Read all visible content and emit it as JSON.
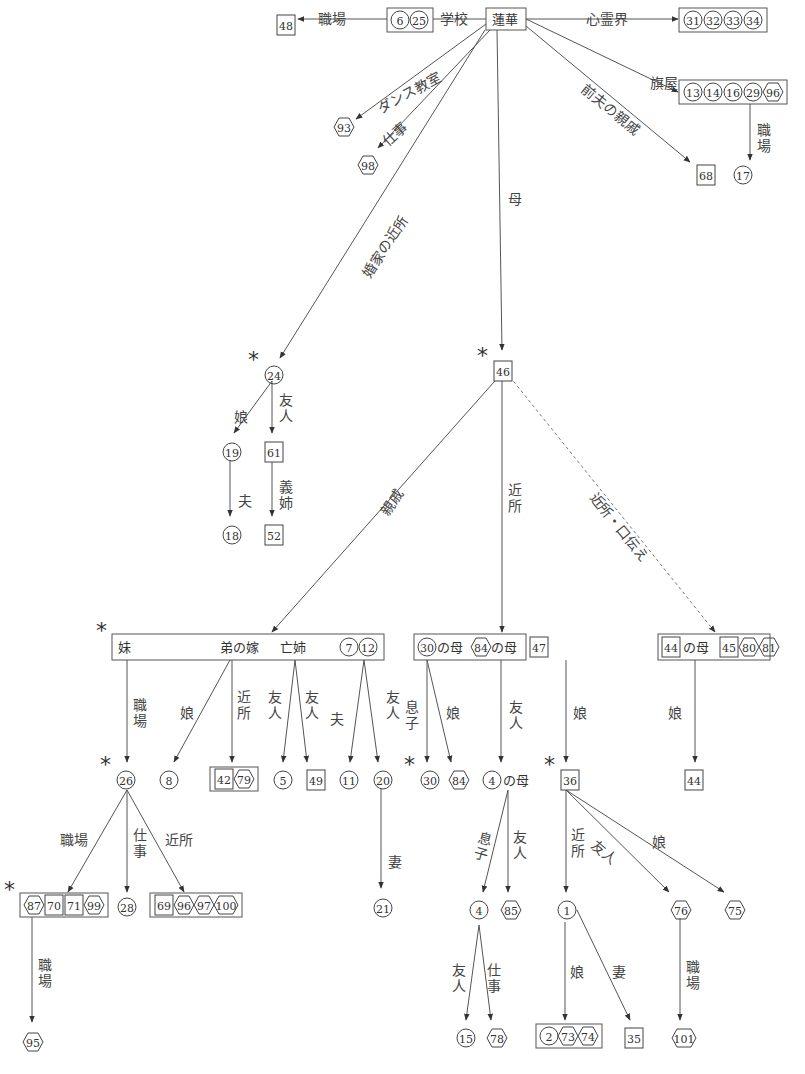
{
  "diagram": {
    "root": "蓮華",
    "nodes": [
      {
        "id": "renge",
        "text": "蓮華",
        "x": 486,
        "y": 8,
        "w": 40,
        "h": 22,
        "boxed": true
      },
      {
        "id": "school",
        "x": 387,
        "y": 8,
        "boxed": true,
        "items": [
          {
            "t": "c",
            "n": "6"
          },
          {
            "t": "c",
            "n": "25"
          }
        ]
      },
      {
        "id": "n48",
        "x": 276,
        "y": 13,
        "items": [
          {
            "t": "s",
            "n": "48"
          }
        ]
      },
      {
        "id": "tokyo",
        "x": 679,
        "y": 8,
        "boxed": true,
        "items": [
          {
            "t": "c",
            "n": "31"
          },
          {
            "t": "c",
            "n": "32"
          },
          {
            "t": "c",
            "n": "33"
          },
          {
            "t": "c",
            "n": "34"
          }
        ],
        "caption": "東京"
      },
      {
        "id": "hataya",
        "x": 679,
        "y": 80,
        "boxed": true,
        "items": [
          {
            "t": "c",
            "n": "13"
          },
          {
            "t": "c",
            "n": "14"
          },
          {
            "t": "c",
            "n": "16"
          },
          {
            "t": "c",
            "n": "29"
          },
          {
            "t": "h",
            "n": "96"
          }
        ]
      },
      {
        "id": "n93",
        "x": 334,
        "y": 115,
        "items": [
          {
            "t": "h",
            "n": "93"
          }
        ]
      },
      {
        "id": "n98",
        "x": 358,
        "y": 153,
        "items": [
          {
            "t": "h",
            "n": "98"
          }
        ]
      },
      {
        "id": "n68",
        "x": 696,
        "y": 163,
        "items": [
          {
            "t": "s",
            "n": "68"
          }
        ]
      },
      {
        "id": "n17",
        "x": 733,
        "y": 163,
        "items": [
          {
            "t": "c",
            "n": "17"
          }
        ]
      },
      {
        "id": "n24",
        "x": 264,
        "y": 363,
        "items": [
          {
            "t": "c",
            "n": "24"
          }
        ],
        "star": true
      },
      {
        "id": "n46",
        "x": 493,
        "y": 359,
        "items": [
          {
            "t": "s",
            "n": "46"
          }
        ],
        "star": true
      },
      {
        "id": "n19",
        "x": 222,
        "y": 440,
        "items": [
          {
            "t": "c",
            "n": "19"
          }
        ]
      },
      {
        "id": "n61",
        "x": 264,
        "y": 440,
        "items": [
          {
            "t": "s",
            "n": "61"
          }
        ]
      },
      {
        "id": "n18",
        "x": 222,
        "y": 523,
        "items": [
          {
            "t": "c",
            "n": "18"
          }
        ]
      },
      {
        "id": "n52",
        "x": 264,
        "y": 523,
        "items": [
          {
            "t": "s",
            "n": "52"
          }
        ]
      },
      {
        "id": "relatives",
        "x": 112,
        "y": 634,
        "w": 272,
        "h": 26,
        "boxed": true,
        "text_parts": [
          "妹",
          "弟の嫁",
          "亡姉"
        ],
        "items": [
          {
            "t": "c",
            "n": "7"
          },
          {
            "t": "c",
            "n": "12"
          }
        ],
        "star": true
      },
      {
        "id": "neighbors",
        "x": 414,
        "y": 634,
        "w": 112,
        "h": 26,
        "boxed": true,
        "text_parts": [
          "の母",
          "の母"
        ],
        "items": [
          {
            "t": "c",
            "n": "30"
          },
          {
            "t": "h",
            "n": "84"
          },
          {
            "t": "s",
            "n": "47"
          }
        ]
      },
      {
        "id": "rumor",
        "x": 658,
        "y": 634,
        "w": 112,
        "h": 26,
        "boxed": true,
        "text_parts": [
          "の母"
        ],
        "items": [
          {
            "t": "s",
            "n": "44"
          },
          {
            "t": "s",
            "n": "45"
          },
          {
            "t": "h",
            "n": "80"
          },
          {
            "t": "h",
            "n": "81"
          }
        ]
      },
      {
        "id": "n26",
        "x": 116,
        "y": 768,
        "items": [
          {
            "t": "c",
            "n": "26"
          }
        ],
        "star": true
      },
      {
        "id": "n8",
        "x": 160,
        "y": 768,
        "items": [
          {
            "t": "c",
            "n": "8"
          }
        ]
      },
      {
        "id": "g42_79",
        "x": 210,
        "y": 767,
        "boxed": true,
        "items": [
          {
            "t": "s",
            "n": "42"
          },
          {
            "t": "h",
            "n": "79"
          }
        ]
      },
      {
        "id": "n5",
        "x": 274,
        "y": 768,
        "items": [
          {
            "t": "c",
            "n": "5"
          }
        ]
      },
      {
        "id": "n49",
        "x": 306,
        "y": 768,
        "items": [
          {
            "t": "s",
            "n": "49"
          }
        ]
      },
      {
        "id": "n11",
        "x": 339,
        "y": 768,
        "items": [
          {
            "t": "c",
            "n": "11"
          }
        ]
      },
      {
        "id": "n20",
        "x": 373,
        "y": 768,
        "items": [
          {
            "t": "c",
            "n": "20"
          }
        ]
      },
      {
        "id": "n30",
        "x": 420,
        "y": 768,
        "items": [
          {
            "t": "c",
            "n": "30"
          }
        ],
        "star": true
      },
      {
        "id": "n84",
        "x": 449,
        "y": 768,
        "items": [
          {
            "t": "h",
            "n": "84"
          }
        ]
      },
      {
        "id": "mother4",
        "x": 483,
        "y": 768,
        "items": [
          {
            "t": "c",
            "n": "4"
          }
        ],
        "suffix": "の母"
      },
      {
        "id": "n36",
        "x": 560,
        "y": 768,
        "items": [
          {
            "t": "s",
            "n": "36"
          }
        ],
        "star": true
      },
      {
        "id": "n44b",
        "x": 684,
        "y": 768,
        "items": [
          {
            "t": "s",
            "n": "44"
          }
        ]
      },
      {
        "id": "g87",
        "x": 20,
        "y": 893,
        "boxed": true,
        "items": [
          {
            "t": "h",
            "n": "87"
          },
          {
            "t": "s",
            "n": "70"
          },
          {
            "t": "s",
            "n": "71"
          },
          {
            "t": "h",
            "n": "99"
          }
        ],
        "star": true
      },
      {
        "id": "n28",
        "x": 117,
        "y": 895,
        "items": [
          {
            "t": "c",
            "n": "28"
          }
        ]
      },
      {
        "id": "g69",
        "x": 150,
        "y": 893,
        "boxed": true,
        "items": [
          {
            "t": "s",
            "n": "69"
          },
          {
            "t": "h",
            "n": "96"
          },
          {
            "t": "h",
            "n": "97"
          },
          {
            "t": "h",
            "n": "100"
          }
        ]
      },
      {
        "id": "n21",
        "x": 373,
        "y": 896,
        "items": [
          {
            "t": "c",
            "n": "21"
          }
        ]
      },
      {
        "id": "n4",
        "x": 470,
        "y": 898,
        "items": [
          {
            "t": "c",
            "n": "4"
          }
        ]
      },
      {
        "id": "n85",
        "x": 501,
        "y": 898,
        "items": [
          {
            "t": "h",
            "n": "85"
          }
        ]
      },
      {
        "id": "n1",
        "x": 558,
        "y": 898,
        "items": [
          {
            "t": "c",
            "n": "1"
          }
        ]
      },
      {
        "id": "n76",
        "x": 671,
        "y": 898,
        "items": [
          {
            "t": "h",
            "n": "76"
          }
        ]
      },
      {
        "id": "n75",
        "x": 725,
        "y": 898,
        "items": [
          {
            "t": "h",
            "n": "75"
          }
        ]
      },
      {
        "id": "n95",
        "x": 23,
        "y": 1030,
        "items": [
          {
            "t": "h",
            "n": "95"
          }
        ]
      },
      {
        "id": "n15",
        "x": 456,
        "y": 1026,
        "items": [
          {
            "t": "c",
            "n": "15"
          }
        ]
      },
      {
        "id": "n78",
        "x": 487,
        "y": 1026,
        "items": [
          {
            "t": "h",
            "n": "78"
          }
        ]
      },
      {
        "id": "g2",
        "x": 536,
        "y": 1024,
        "boxed": true,
        "items": [
          {
            "t": "c",
            "n": "2"
          },
          {
            "t": "h",
            "n": "73"
          },
          {
            "t": "h",
            "n": "74"
          }
        ]
      },
      {
        "id": "n35",
        "x": 624,
        "y": 1026,
        "items": [
          {
            "t": "s",
            "n": "35"
          }
        ]
      },
      {
        "id": "n101",
        "x": 672,
        "y": 1026,
        "items": [
          {
            "t": "h",
            "n": "101"
          }
        ]
      }
    ],
    "edges": [
      {
        "from": [
          486,
          19
        ],
        "to": [
          426,
          19
        ],
        "label": "学校",
        "lx": 440,
        "ly": 12
      },
      {
        "from": [
          387,
          19
        ],
        "to": [
          298,
          19
        ],
        "label": "職場",
        "lx": 318,
        "ly": 12
      },
      {
        "from": [
          526,
          19
        ],
        "to": [
          678,
          19
        ],
        "label": "心霊界",
        "lx": 586,
        "ly": 12
      },
      {
        "from": [
          526,
          19
        ],
        "to": [
          678,
          92
        ],
        "label": "旗屋",
        "lx": 650,
        "ly": 76
      },
      {
        "from": [
          750,
          103
        ],
        "to": [
          750,
          160
        ],
        "label": "職場",
        "vertical": true,
        "lx": 757,
        "ly": 123
      },
      {
        "from": [
          486,
          24
        ],
        "to": [
          356,
          119
        ],
        "label": "ダンス教室",
        "rot": -28,
        "lx": 375,
        "ly": 103
      },
      {
        "from": [
          490,
          30
        ],
        "to": [
          378,
          148
        ],
        "label": "仕事",
        "rot": -42,
        "lx": 380,
        "ly": 138
      },
      {
        "from": [
          526,
          26
        ],
        "to": [
          690,
          162
        ],
        "label": "前夫の親戚",
        "rot": 39,
        "lx": 588,
        "ly": 82
      },
      {
        "from": [
          497,
          30
        ],
        "to": [
          502,
          350
        ],
        "label": "母",
        "lx": 508,
        "ly": 192
      },
      {
        "from": [
          485,
          30
        ],
        "to": [
          280,
          358
        ],
        "label": "婚家の近所",
        "rot": -57,
        "lx": 360,
        "ly": 272
      },
      {
        "from": [
          272,
          381
        ],
        "to": [
          234,
          433
        ],
        "label": "娘",
        "lx": 234,
        "ly": 410
      },
      {
        "from": [
          272,
          381
        ],
        "to": [
          272,
          433
        ],
        "label": "友人",
        "vertical": true,
        "lx": 279,
        "ly": 393
      },
      {
        "from": [
          230,
          460
        ],
        "to": [
          230,
          516
        ],
        "label": "夫",
        "lx": 238,
        "ly": 494
      },
      {
        "from": [
          272,
          460
        ],
        "to": [
          272,
          516
        ],
        "label": "義姉",
        "vertical": true,
        "lx": 279,
        "ly": 480
      },
      {
        "from": [
          502,
          373
        ],
        "to": [
          272,
          632
        ],
        "label": "親戚",
        "rot": -55,
        "lx": 378,
        "ly": 510
      },
      {
        "from": [
          502,
          373
        ],
        "to": [
          502,
          632
        ],
        "label": "近所",
        "vertical": true,
        "lx": 508,
        "ly": 483
      },
      {
        "from": [
          506,
          372
        ],
        "to": [
          715,
          632
        ],
        "label": "近所・口伝え",
        "rot": 51,
        "lx": 598,
        "ly": 490,
        "dashed": true
      },
      {
        "from": [
          127,
          660
        ],
        "to": [
          127,
          762
        ],
        "label": "職場",
        "vertical": true,
        "lx": 133,
        "ly": 698
      },
      {
        "from": [
          230,
          660
        ],
        "to": [
          174,
          762
        ],
        "label": "娘",
        "vertical": false,
        "lx": 180,
        "ly": 706
      },
      {
        "from": [
          232,
          660
        ],
        "to": [
          232,
          762
        ],
        "label": "近所",
        "vertical": true,
        "lx": 237,
        "ly": 690
      },
      {
        "from": [
          295,
          660
        ],
        "to": [
          283,
          762
        ],
        "label": "友人",
        "vertical": true,
        "lx": 268,
        "ly": 690
      },
      {
        "from": [
          295,
          660
        ],
        "to": [
          307,
          762
        ],
        "label": "友人",
        "vertical": true,
        "lx": 305,
        "ly": 690
      },
      {
        "from": [
          364,
          660
        ],
        "to": [
          350,
          762
        ],
        "label": "夫",
        "lx": 330,
        "ly": 712
      },
      {
        "from": [
          364,
          660
        ],
        "to": [
          378,
          762
        ],
        "label": "友人",
        "vertical": true,
        "lx": 386,
        "ly": 690
      },
      {
        "from": [
          427,
          660
        ],
        "to": [
          427,
          762
        ],
        "label": "息子",
        "vertical": true,
        "lx": 405,
        "ly": 700
      },
      {
        "from": [
          427,
          660
        ],
        "to": [
          451,
          762
        ],
        "label": "娘",
        "lx": 446,
        "ly": 706
      },
      {
        "from": [
          501,
          660
        ],
        "to": [
          501,
          762
        ],
        "label": "友人",
        "vertical": true,
        "lx": 509,
        "ly": 700
      },
      {
        "from": [
          566,
          660
        ],
        "to": [
          566,
          762
        ],
        "label": "娘",
        "lx": 573,
        "ly": 706
      },
      {
        "from": [
          695,
          660
        ],
        "to": [
          695,
          762
        ],
        "label": "娘",
        "lx": 668,
        "ly": 706
      },
      {
        "from": [
          127,
          790
        ],
        "to": [
          68,
          892
        ],
        "label": "職場",
        "lx": 60,
        "ly": 833
      },
      {
        "from": [
          127,
          790
        ],
        "to": [
          127,
          892
        ],
        "label": "仕事",
        "vertical": true,
        "lx": 133,
        "ly": 828
      },
      {
        "from": [
          127,
          790
        ],
        "to": [
          184,
          892
        ],
        "label": "近所",
        "lx": 165,
        "ly": 833
      },
      {
        "from": [
          381,
          789
        ],
        "to": [
          381,
          888
        ],
        "label": "妻",
        "lx": 388,
        "ly": 855
      },
      {
        "from": [
          32,
          917
        ],
        "to": [
          32,
          1022
        ],
        "label": "職場",
        "vertical": true,
        "lx": 38,
        "ly": 958
      },
      {
        "from": [
          508,
          790
        ],
        "to": [
          483,
          892
        ],
        "label": "息子",
        "rot": 15,
        "vertical": true,
        "lx": 480,
        "ly": 830
      },
      {
        "from": [
          508,
          790
        ],
        "to": [
          508,
          892
        ],
        "label": "友人",
        "vertical": true,
        "lx": 513,
        "ly": 830
      },
      {
        "from": [
          566,
          790
        ],
        "to": [
          566,
          892
        ],
        "label": "近所",
        "vertical": true,
        "lx": 571,
        "ly": 828
      },
      {
        "from": [
          566,
          790
        ],
        "to": [
          669,
          892
        ],
        "label": "友人",
        "rot": 40,
        "lx": 598,
        "ly": 838
      },
      {
        "from": [
          566,
          790
        ],
        "to": [
          724,
          892
        ],
        "label": "娘",
        "lx": 652,
        "ly": 835
      },
      {
        "from": [
          479,
          925
        ],
        "to": [
          466,
          1020
        ],
        "label": "友人",
        "vertical": true,
        "lx": 452,
        "ly": 963
      },
      {
        "from": [
          479,
          925
        ],
        "to": [
          491,
          1020
        ],
        "label": "仕事",
        "vertical": true,
        "lx": 487,
        "ly": 963
      },
      {
        "from": [
          565,
          922
        ],
        "to": [
          565,
          1020
        ],
        "label": "娘",
        "lx": 570,
        "ly": 965
      },
      {
        "from": [
          577,
          910
        ],
        "to": [
          630,
          1020
        ],
        "label": "妻",
        "lx": 612,
        "ly": 965
      },
      {
        "from": [
          680,
          918
        ],
        "to": [
          680,
          1020
        ],
        "label": "職場",
        "vertical": true,
        "lx": 686,
        "ly": 960
      }
    ]
  },
  "legend": {
    "circle": "circle-numbered person",
    "square": "square-numbered person",
    "hexagon": "hexagon-numbered person",
    "star": "*"
  },
  "colors": {
    "line": "#555555",
    "text": "#333333",
    "background": "#ffffff"
  }
}
